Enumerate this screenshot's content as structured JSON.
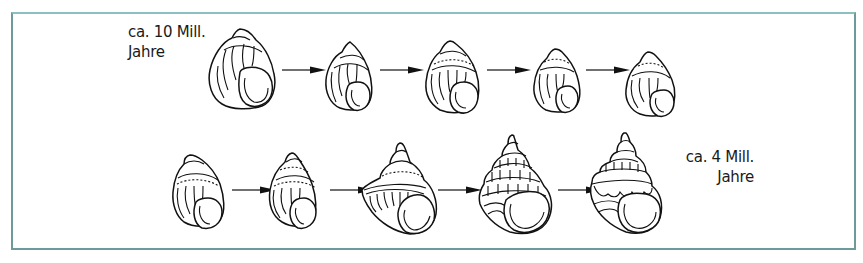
{
  "figure": {
    "frame_color": "#6f9a9c",
    "start_label": {
      "line1": "ca. 10 Mill.",
      "line2": "Jahre"
    },
    "end_label": {
      "line1": "ca. 4 Mill.",
      "line2": "Jahre"
    },
    "rows": [
      {
        "name": "top-row",
        "shells": [
          {
            "id": 1,
            "form": "smooth-rounded",
            "ornament": "axial-ribs"
          },
          {
            "id": 2,
            "form": "rounded",
            "ornament": "axial-ribs"
          },
          {
            "id": 3,
            "form": "rounded",
            "ornament": "axial-ribs-spiral-line"
          },
          {
            "id": 4,
            "form": "rounded",
            "ornament": "axial-ribs-spiral-dots"
          },
          {
            "id": 5,
            "form": "rounded",
            "ornament": "axial-ribs-spiral-dots"
          }
        ],
        "arrows": 4
      },
      {
        "name": "bottom-row",
        "shells": [
          {
            "id": 6,
            "form": "shouldered",
            "ornament": "axial-ribs-spiral-band"
          },
          {
            "id": 7,
            "form": "conical",
            "ornament": "axial-ribs-spiral-band"
          },
          {
            "id": 8,
            "form": "keeled",
            "ornament": "carina-ribs"
          },
          {
            "id": 9,
            "form": "stepped",
            "ornament": "multiple-carinae"
          },
          {
            "id": 10,
            "form": "pagoda",
            "ornament": "strong-carinae-nodes"
          }
        ],
        "arrows": 4
      }
    ]
  }
}
